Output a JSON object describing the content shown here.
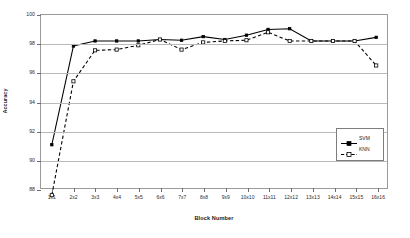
{
  "chart_data": {
    "type": "line",
    "title": "",
    "xlabel": "Block Number",
    "ylabel": "Accuracy",
    "categories": [
      "1x1",
      "2x2",
      "3x3",
      "4x4",
      "5x5",
      "6x6",
      "7x7",
      "8x8",
      "9x9",
      "10x10",
      "11x11",
      "12x12",
      "13x13",
      "14x14",
      "15x15",
      "16x16"
    ],
    "ylim": [
      88,
      100
    ],
    "yticks": [
      88,
      90,
      92,
      94,
      96,
      98,
      100
    ],
    "grid": true,
    "legend_position": "inside-bottom-right",
    "series": [
      {
        "name": "SVM",
        "marker": "filled-square",
        "linestyle": "solid",
        "color": "#000000",
        "values": [
          91.0,
          97.85,
          98.2,
          98.2,
          98.2,
          98.3,
          98.25,
          98.5,
          98.3,
          98.6,
          99.0,
          99.05,
          98.2,
          98.2,
          98.2,
          98.45
        ]
      },
      {
        "name": "KNN",
        "marker": "open-square",
        "linestyle": "dashed",
        "color": "#000000",
        "values": [
          87.5,
          95.4,
          97.55,
          97.6,
          97.9,
          98.3,
          97.6,
          98.1,
          98.2,
          98.25,
          98.8,
          98.2,
          98.2,
          98.2,
          98.2,
          96.5
        ]
      }
    ]
  },
  "legend": {
    "items": [
      {
        "label": "SVM"
      },
      {
        "label": "KNN"
      }
    ]
  },
  "caption": {
    "text": ""
  }
}
